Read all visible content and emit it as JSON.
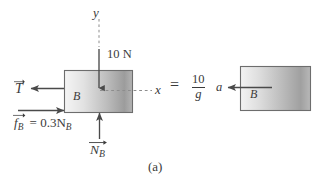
{
  "figure": {
    "caption": "(a)",
    "equals_sign": "=",
    "background_color": "#ffffff",
    "ink_color": "#3b3b3b"
  },
  "axes": {
    "y_label": "y",
    "x_label": "x",
    "style": "dashed"
  },
  "left_body": {
    "block_label": "B",
    "applied_force_label": "10 N",
    "tension_label": "T",
    "tension_subscript": "",
    "friction_label": "f",
    "friction_subscript": "B",
    "friction_equation": "= 0.3N",
    "friction_equation_subscript": "B",
    "normal_label": "N",
    "normal_subscript": "B"
  },
  "right_body": {
    "block_label": "B",
    "accel_label": "a",
    "mass_numerator": "10",
    "mass_denominator": "g"
  },
  "colors": {
    "block_fill_light": "#f2f2f2",
    "block_fill_dark": "#9a9a9a",
    "block_border": "#6d6d6d",
    "arrow": "#4a4a4a"
  }
}
